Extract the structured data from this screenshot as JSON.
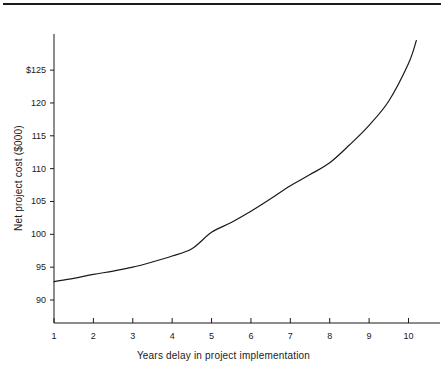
{
  "figure": {
    "has_top_rule": true,
    "background_color": "#ffffff",
    "line_color": "#1a1a1a"
  },
  "axis_label_x": "Years delay in project implementation",
  "axis_label_y": "Net project cost ($000)",
  "chart_data": {
    "type": "line",
    "title": "",
    "xlabel": "Years delay in project implementation",
    "ylabel": "Net project cost ($000)",
    "xlim": [
      1,
      10.8
    ],
    "ylim": [
      86.5,
      130.5
    ],
    "xticks": [
      1,
      2,
      3,
      4,
      5,
      6,
      7,
      8,
      9,
      10
    ],
    "xticklabels": [
      "1",
      "2",
      "3",
      "4",
      "5",
      "6",
      "7",
      "8",
      "9",
      "10"
    ],
    "yticks": [
      90,
      95,
      100,
      105,
      110,
      115,
      120,
      125
    ],
    "yticklabels": [
      "90",
      "95",
      "100",
      "105",
      "110",
      "115",
      "120",
      "$125"
    ],
    "grid": false,
    "legend": null,
    "series": [
      {
        "name": "Net project cost",
        "x": [
          1,
          1.5,
          2,
          2.5,
          3,
          3.5,
          4,
          4.5,
          5,
          5.5,
          6,
          6.5,
          7,
          7.5,
          8,
          8.5,
          9,
          9.5,
          10,
          10.2
        ],
        "values": [
          92.8,
          93.3,
          93.9,
          94.4,
          95.0,
          95.8,
          96.7,
          97.8,
          100.3,
          101.8,
          103.5,
          105.4,
          107.4,
          109.1,
          110.9,
          113.6,
          116.6,
          120.3,
          126.0,
          129.5
        ]
      }
    ]
  }
}
